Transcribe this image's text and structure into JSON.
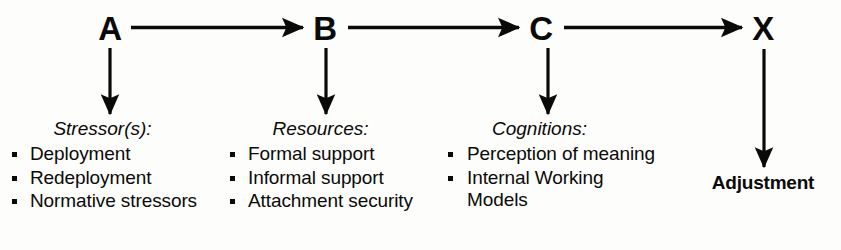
{
  "diagram": {
    "nodes": [
      {
        "id": "a",
        "label": "A"
      },
      {
        "id": "b",
        "label": "B"
      },
      {
        "id": "c",
        "label": "C"
      },
      {
        "id": "x",
        "label": "X"
      }
    ],
    "outcome": {
      "label": "Adjustment"
    },
    "categories": [
      {
        "title": "Stressor(s):",
        "items": [
          "Deployment",
          "Redeployment",
          "Normative stressors"
        ]
      },
      {
        "title": "Resources:",
        "items": [
          "Formal support",
          "Informal support",
          "Attachment security"
        ]
      },
      {
        "title": "Cognitions:",
        "items": [
          "Perception of meaning",
          "Internal Working Models"
        ]
      }
    ],
    "connectors": [
      {
        "name": "a-to-b",
        "direction": "right"
      },
      {
        "name": "b-to-c",
        "direction": "right"
      },
      {
        "name": "c-to-x",
        "direction": "right"
      },
      {
        "name": "a-to-stressors",
        "direction": "down"
      },
      {
        "name": "b-to-resources",
        "direction": "down"
      },
      {
        "name": "c-to-cognitions",
        "direction": "down"
      },
      {
        "name": "x-to-adjustment",
        "direction": "down"
      }
    ],
    "colors": {
      "ink": "#0a0a0a",
      "background": "#fdfdfb"
    }
  }
}
